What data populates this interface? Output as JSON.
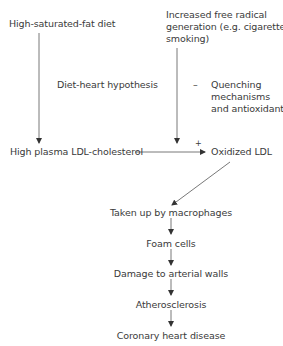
{
  "diagram": {
    "nodes": {
      "sat_fat": "High-saturated-fat diet",
      "free_radical_1": "Increased free radical",
      "free_radical_2": "generation (e.g. cigarette",
      "free_radical_3": "smoking)",
      "ldl_chol": "High plasma LDL-cholesterol",
      "oxidized_ldl": "Oxidized LDL",
      "macrophages": "Taken up by macrophages",
      "foam_cells": "Foam cells",
      "damage": "Damage to arterial walls",
      "atherosclerosis": "Atherosclerosis",
      "chd": "Coronary heart disease"
    },
    "annotations": {
      "diet_heart": "Diet-heart hypothesis",
      "minus_sign": "–",
      "quench_1": "Quenching",
      "quench_2": "mechanisms",
      "quench_3": "and antioxidants",
      "plus_sign": "+"
    },
    "colors": {
      "line": "#555555",
      "text": "#3a3a3a"
    }
  }
}
